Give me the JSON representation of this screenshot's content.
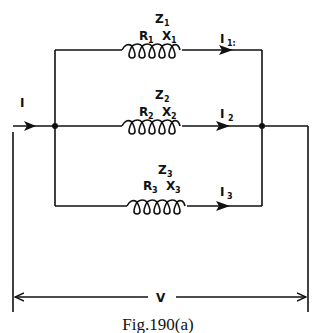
{
  "figure": {
    "caption": "Fig.190(a)",
    "type": "parallel AC circuit with three inductive branches"
  },
  "supply": {
    "current_label": "I",
    "voltage_label": "V"
  },
  "branches": [
    {
      "impedance": "Z",
      "impedance_sub": "1",
      "resistance": "R",
      "resistance_sub": "1",
      "reactance": "X",
      "reactance_sub": "1",
      "current": "I",
      "current_sub": "1:"
    },
    {
      "impedance": "Z",
      "impedance_sub": "2",
      "resistance": "R",
      "resistance_sub": "2",
      "reactance": "X",
      "reactance_sub": "2",
      "current": "I",
      "current_sub": "2"
    },
    {
      "impedance": "Z",
      "impedance_sub": "3",
      "resistance": "R",
      "resistance_sub": "3",
      "reactance": "X",
      "reactance_sub": "3",
      "current": "I",
      "current_sub": "3"
    }
  ],
  "colors": {
    "ink": "#111111",
    "background": "#ffffff"
  }
}
